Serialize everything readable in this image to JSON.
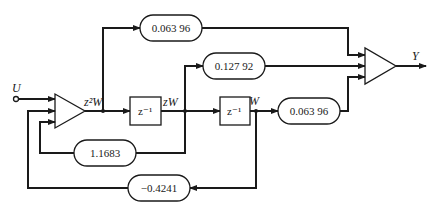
{
  "diagram": {
    "type": "signal-flow block diagram (second-order digital filter, direct form)",
    "input_label": "U",
    "output_label": "Y",
    "signals": {
      "z2W": "z²W",
      "zW": "zW",
      "W": "W"
    },
    "delays": [
      {
        "id": "delay-1",
        "label": "z⁻¹"
      },
      {
        "id": "delay-2",
        "label": "z⁻¹"
      }
    ],
    "gains": {
      "feedforward_0": "0.063 96",
      "feedforward_1": "0.127 92",
      "feedforward_2": "0.063 96",
      "feedback_1": "1.1683",
      "feedback_2": "−0.4241"
    },
    "summers": [
      {
        "id": "input-summer",
        "inputs": [
          "U",
          "1.1683·zW",
          "−0.4241·W"
        ],
        "output": "z²W"
      },
      {
        "id": "output-summer",
        "inputs": [
          "0.06396·z²W",
          "0.12792·zW",
          "0.06396·W"
        ],
        "output": "Y"
      }
    ]
  }
}
